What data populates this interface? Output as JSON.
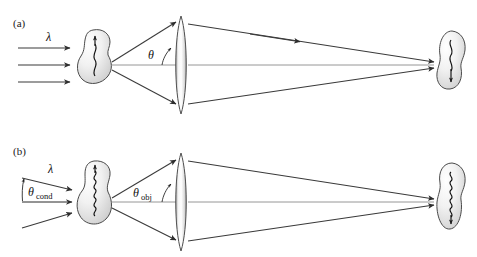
{
  "figure": {
    "type": "optical-ray-diagram",
    "title": "",
    "background_color": "#ffffff",
    "ray_color": "#3a3a3a",
    "axis_color": "#8a8a8a",
    "blob_fill_start": "#ffffff",
    "blob_fill_end": "#d0d0d0",
    "lens_fill_start": "#ffffff",
    "lens_fill_end": "#b9b9b9"
  },
  "panels": [
    {
      "id": "a",
      "label": "(a)",
      "illumination": {
        "style": "parallel",
        "ray_count": 3,
        "wavelength_symbol": "λ",
        "angle_label": null,
        "angle_subscript": null
      },
      "specimen": {
        "name": "specimen-blob",
        "wave_cycles": 2,
        "wave_description": "long-wavelength wave arrow"
      },
      "collection": {
        "angle_symbol": "θ",
        "angle_subscript": "",
        "ray_count": 3
      },
      "lens": {
        "name": "objective-lens",
        "shape": "biconvex"
      },
      "detector": {
        "name": "detector-blob",
        "wave_cycles": 2,
        "wave_description": "long-wavelength wave arrow"
      }
    },
    {
      "id": "b",
      "label": "(b)",
      "illumination": {
        "style": "converging",
        "ray_count": 3,
        "wavelength_symbol": "λ",
        "angle_label": "θ",
        "angle_subscript": "cond"
      },
      "specimen": {
        "name": "specimen-blob",
        "wave_cycles": 5,
        "wave_description": "short-wavelength wave arrow"
      },
      "collection": {
        "angle_symbol": "θ",
        "angle_subscript": "obj",
        "ray_count": 3
      },
      "lens": {
        "name": "objective-lens",
        "shape": "biconvex"
      },
      "detector": {
        "name": "detector-blob",
        "wave_cycles": 5,
        "wave_description": "short-wavelength wave arrow"
      }
    }
  ]
}
